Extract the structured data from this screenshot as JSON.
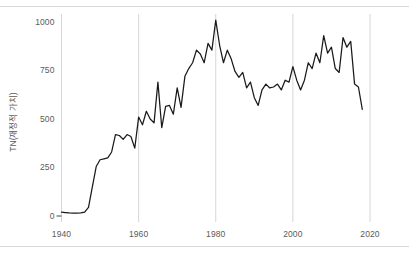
{
  "chart_data": {
    "type": "line",
    "title": "",
    "xlabel": "",
    "ylabel": "TN(재정적 가치)",
    "xlim": [
      1940,
      2020
    ],
    "ylim": [
      0,
      1000
    ],
    "grid": "vertical-only",
    "legend": "none",
    "line_color": "#1a1a1a",
    "gridline_color": "#d6d6d6",
    "axis_text_color": "#5a5a5a",
    "background_color": "#ffffff",
    "xticks": [
      "1940",
      "1960",
      "1980",
      "2000",
      "2020"
    ],
    "yticks": [
      "0",
      "250",
      "500",
      "750",
      "1000"
    ],
    "series": [
      {
        "name": "TN(재정적 가치)",
        "x": [
          1940,
          1941,
          1942,
          1943,
          1944,
          1945,
          1946,
          1947,
          1948,
          1949,
          1950,
          1951,
          1952,
          1953,
          1954,
          1955,
          1956,
          1957,
          1958,
          1959,
          1960,
          1961,
          1962,
          1963,
          1964,
          1965,
          1966,
          1967,
          1968,
          1969,
          1970,
          1971,
          1972,
          1973,
          1974,
          1975,
          1976,
          1977,
          1978,
          1979,
          1980,
          1981,
          1982,
          1983,
          1984,
          1985,
          1986,
          1987,
          1988,
          1989,
          1990,
          1991,
          1992,
          1993,
          1994,
          1995,
          1996,
          1997,
          1998,
          1999,
          2000,
          2001,
          2002,
          2003,
          2004,
          2005,
          2006,
          2007,
          2008,
          2009,
          2010,
          2011,
          2012,
          2013,
          2014,
          2015,
          2016,
          2017,
          2018
        ],
        "y": [
          20,
          18,
          16,
          15,
          15,
          16,
          20,
          45,
          150,
          255,
          290,
          295,
          300,
          330,
          420,
          415,
          395,
          420,
          410,
          350,
          510,
          470,
          540,
          500,
          480,
          690,
          455,
          565,
          570,
          525,
          660,
          560,
          720,
          760,
          790,
          855,
          835,
          790,
          890,
          855,
          1010,
          880,
          790,
          855,
          810,
          745,
          715,
          740,
          660,
          690,
          610,
          570,
          650,
          680,
          660,
          665,
          680,
          650,
          700,
          690,
          770,
          700,
          650,
          700,
          790,
          760,
          840,
          790,
          930,
          840,
          870,
          760,
          740,
          920,
          870,
          900,
          680,
          665,
          550
        ]
      }
    ]
  },
  "axis": {
    "y_title": "TN(재정적 가치)",
    "y_ticks": [
      {
        "label": "1000",
        "value": 1000
      },
      {
        "label": "750",
        "value": 750
      },
      {
        "label": "500",
        "value": 500
      },
      {
        "label": "250",
        "value": 250
      },
      {
        "label": "0",
        "value": 0
      }
    ],
    "x_ticks": [
      {
        "label": "1940",
        "value": 1940
      },
      {
        "label": "1960",
        "value": 1960
      },
      {
        "label": "1980",
        "value": 1980
      },
      {
        "label": "2000",
        "value": 2000
      },
      {
        "label": "2020",
        "value": 2020
      }
    ]
  }
}
